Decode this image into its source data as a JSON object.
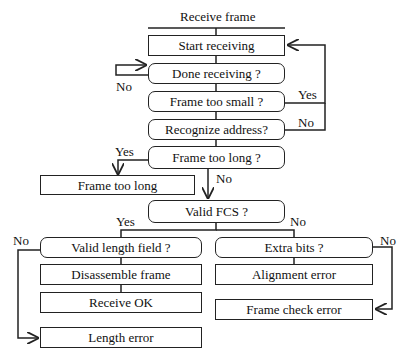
{
  "title": "Receive frame",
  "nodes": {
    "start_receiving": "Start receiving",
    "done_receiving": "Done receiving ?",
    "frame_too_small": "Frame too small ?",
    "recognize_address": "Recognize address?",
    "frame_too_long_q": "Frame too long ?",
    "frame_too_long": "Frame too long",
    "valid_fcs": "Valid FCS ?",
    "valid_length_field": "Valid length field ?",
    "disassemble_frame": "Disassemble frame",
    "receive_ok": "Receive OK",
    "length_error": "Length error",
    "extra_bits": "Extra bits ?",
    "alignment_error": "Alignment error",
    "frame_check_error": "Frame check error"
  },
  "edge_labels": {
    "done_no": "No",
    "small_yes": "Yes",
    "address_no": "No",
    "long_yes": "Yes",
    "long_no": "No",
    "fcs_yes": "Yes",
    "fcs_no": "No",
    "length_no": "No",
    "extra_no": "No"
  }
}
